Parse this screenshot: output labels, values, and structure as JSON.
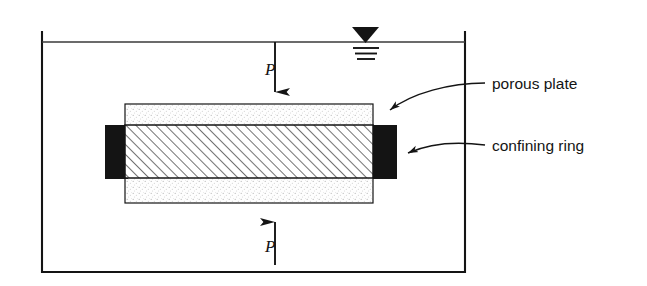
{
  "figure": {
    "type": "engineering-diagram",
    "background_color": "#ffffff",
    "line_color": "#141414"
  },
  "container": {
    "name": "water bath container",
    "x": 42,
    "y": 32,
    "width": 423,
    "height": 240,
    "open_top": true,
    "stroke_color": "#141414"
  },
  "water": {
    "surface_line_y": 42,
    "symbol_name": "water-table-symbol",
    "symbol_x": 365,
    "triangle_fill": "#141414",
    "tick_line_count": 3
  },
  "porous_plate": {
    "label": "porous plate",
    "x": 125,
    "y": 104,
    "width": 248,
    "height": 99,
    "fill_pattern": "stipple",
    "fill_color": "#fdfdfd",
    "stroke_color": "#141414"
  },
  "specimen": {
    "name": "soil specimen",
    "x": 125,
    "y": 125,
    "width": 248,
    "height": 53,
    "fill_pattern": "diagonal-hatch-45",
    "stroke_color": "#141414"
  },
  "confining_ring": {
    "label": "confining ring",
    "fill_color": "#141414",
    "left_block": {
      "x": 105,
      "y": 125,
      "width": 23,
      "height": 54
    },
    "right_block": {
      "x": 373,
      "y": 125,
      "width": 24,
      "height": 54
    }
  },
  "loads": [
    {
      "name": "top-load-arrow",
      "symbol": "P",
      "direction": "down",
      "x": 275,
      "from_y": 42,
      "to_y": 107,
      "label_x": 265,
      "label_y": 75
    },
    {
      "name": "bottom-load-arrow",
      "symbol": "P",
      "direction": "up",
      "x": 275,
      "from_y": 265,
      "to_y": 207,
      "label_x": 265,
      "label_y": 252
    }
  ],
  "callouts": [
    {
      "name": "porous-plate-callout",
      "label": "porous plate",
      "label_x": 492,
      "label_y": 89,
      "leader_start_x": 485,
      "leader_start_y": 83,
      "arrow_x": 381,
      "arrow_y": 113
    },
    {
      "name": "confining-ring-callout",
      "label": "confining ring",
      "label_x": 492,
      "label_y": 151,
      "leader_start_x": 485,
      "leader_start_y": 145,
      "arrow_x": 399,
      "arrow_y": 156
    }
  ]
}
